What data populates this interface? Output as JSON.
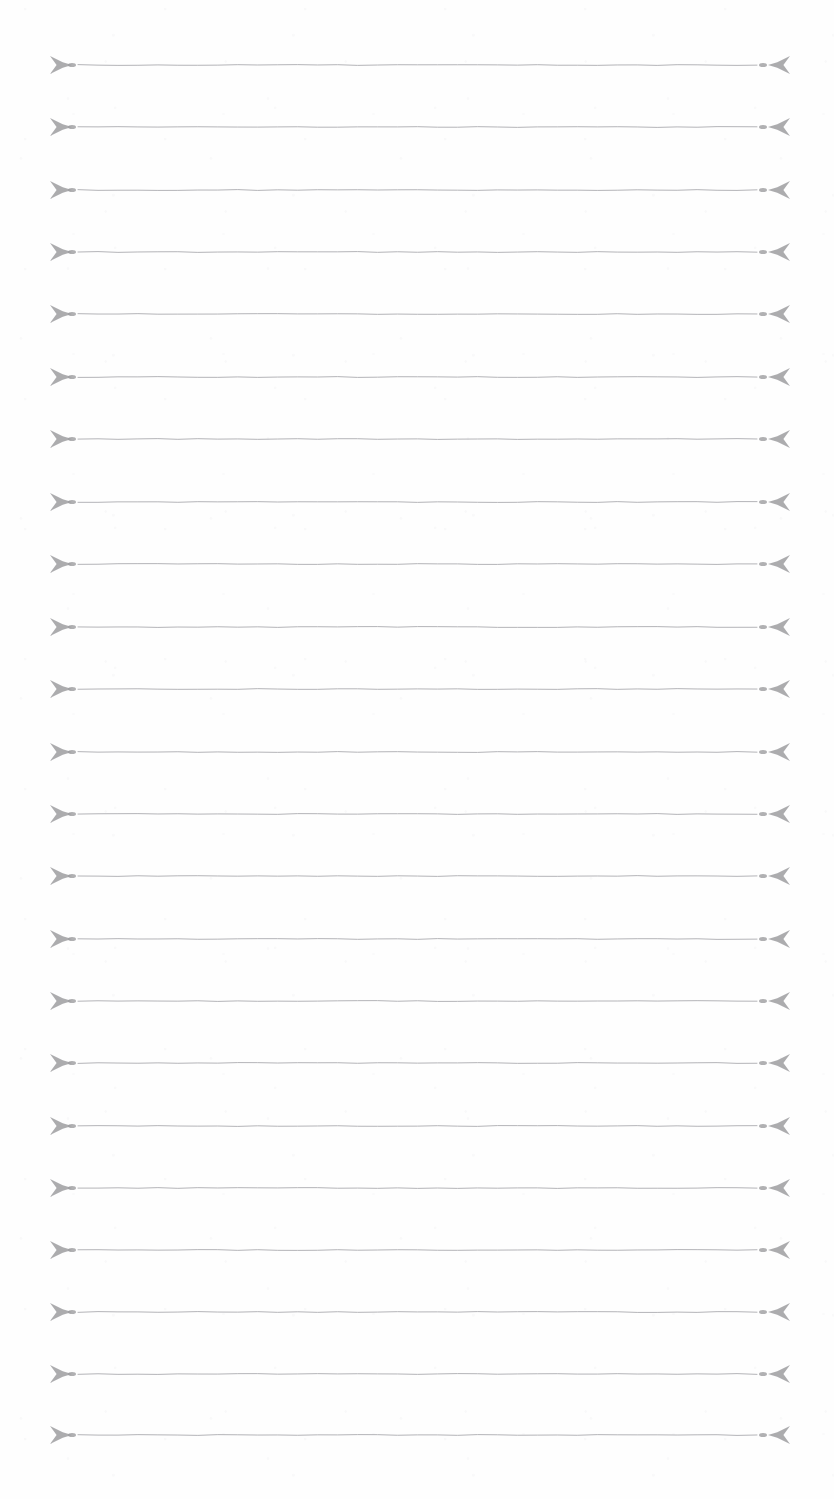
{
  "page": {
    "kind": "scanned-ruled-divider-sheet",
    "width": 834,
    "height": 1499,
    "background_color": "#fefefe",
    "paper_tone": "#ffffff",
    "ink_color": "#9a9a9c",
    "ink_color_light": "#b4b4b8",
    "orientation": "portrait",
    "visible_text": ""
  },
  "ruling": {
    "line_count": 23,
    "first_line_y": 65,
    "line_spacing": 62.3,
    "last_line_y": 1435,
    "line_stroke_width": 1,
    "left_margin_x": 50,
    "right_margin_x": 790,
    "line_start_x": 78,
    "line_end_x": 757,
    "left_dot_x": 72,
    "right_dot_x": 763,
    "dot_radius": 2.6,
    "ornament_half_height": 9,
    "ornament_length": 22
  },
  "ornament": {
    "name": "dart-arrowhead",
    "description": "four-pointed swept dart ornament terminating each ruled line",
    "left_icon": "arrow-dart-right-icon",
    "right_icon": "arrow-dart-left-icon",
    "endpoint_icon": "endpoint-dot-icon"
  },
  "lines": [
    {
      "index": 1,
      "y": 65
    },
    {
      "index": 2,
      "y": 127
    },
    {
      "index": 3,
      "y": 190
    },
    {
      "index": 4,
      "y": 252
    },
    {
      "index": 5,
      "y": 314
    },
    {
      "index": 6,
      "y": 377
    },
    {
      "index": 7,
      "y": 439
    },
    {
      "index": 8,
      "y": 502
    },
    {
      "index": 9,
      "y": 564
    },
    {
      "index": 10,
      "y": 627
    },
    {
      "index": 11,
      "y": 689
    },
    {
      "index": 12,
      "y": 752
    },
    {
      "index": 13,
      "y": 814
    },
    {
      "index": 14,
      "y": 876
    },
    {
      "index": 15,
      "y": 939
    },
    {
      "index": 16,
      "y": 1001
    },
    {
      "index": 17,
      "y": 1063
    },
    {
      "index": 18,
      "y": 1126
    },
    {
      "index": 19,
      "y": 1188
    },
    {
      "index": 20,
      "y": 1250
    },
    {
      "index": 21,
      "y": 1312
    },
    {
      "index": 22,
      "y": 1374
    },
    {
      "index": 23,
      "y": 1435
    }
  ]
}
